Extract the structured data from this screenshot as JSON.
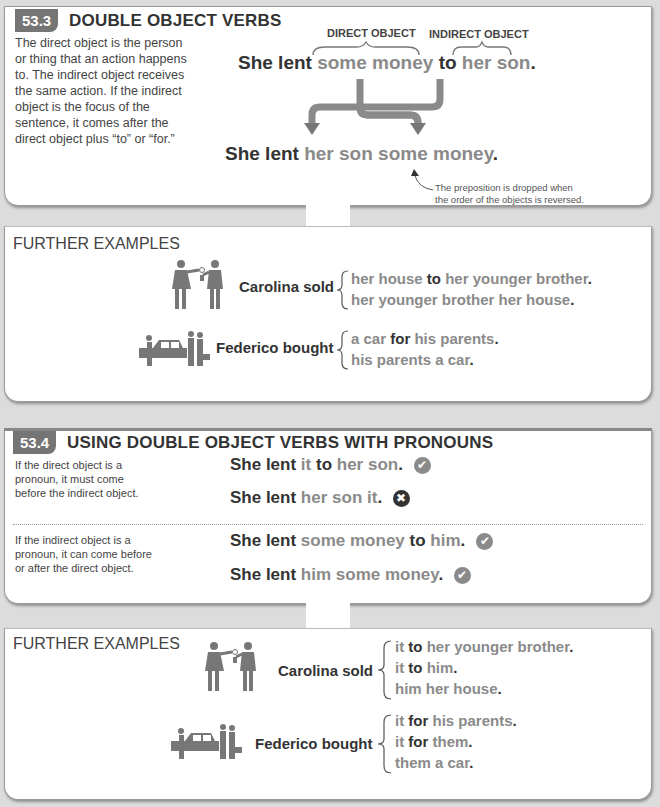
{
  "section1": {
    "number": "53.3",
    "title": "DOUBLE OBJECT VERBS",
    "description": [
      "The direct object is the person",
      "or thing that an action happens",
      "to. The indirect object receives",
      "the same action. If the indirect",
      "object is the focus of the",
      "sentence, it comes after the",
      "direct object plus “to” or “for.”"
    ],
    "direct_object_label": "DIRECT OBJECT",
    "indirect_object_label": "INDIRECT OBJECT",
    "sentence1": {
      "subject": "She lent",
      "direct": "some money",
      "prep": "to",
      "indirect": "her son",
      "end": "."
    },
    "sentence2": {
      "subject": "She lent",
      "indirect": "her son",
      "direct": "some money",
      "end": "."
    },
    "note": [
      "The preposition is dropped when",
      "the order of the objects is reversed."
    ]
  },
  "examples1": {
    "title": "FURTHER EXAMPLES",
    "items": [
      {
        "icon": "people-handing-keys-icon",
        "subject": "Carolina sold",
        "options": [
          {
            "a": "her house",
            "prep": "to",
            "b": "her younger brother",
            "end": "."
          },
          {
            "a": "her younger brother her house",
            "prep": "",
            "b": "",
            "end": "."
          }
        ]
      },
      {
        "icon": "people-with-car-icon",
        "subject": "Federico bought",
        "options": [
          {
            "a": "a car",
            "prep": "for",
            "b": "his parents",
            "end": "."
          },
          {
            "a": "his parents a car",
            "prep": "",
            "b": "",
            "end": "."
          }
        ]
      }
    ]
  },
  "section2": {
    "number": "53.4",
    "title": "USING DOUBLE OBJECT VERBS WITH PRONOUNS",
    "rules": [
      {
        "description": [
          "If the direct object is a",
          "pronoun, it must come",
          "before the indirect object."
        ],
        "sentences": [
          {
            "subject": "She lent",
            "a": "it",
            "prep": "to",
            "b": "her son",
            "end": ".",
            "status": "correct"
          },
          {
            "subject": "She lent",
            "a": "her son it",
            "prep": "",
            "b": "",
            "end": ".",
            "status": "incorrect"
          }
        ]
      },
      {
        "description": [
          "If the indirect object is a",
          "pronoun, it can come before",
          "or after the direct object."
        ],
        "sentences": [
          {
            "subject": "She lent",
            "a": "some money",
            "prep": "to",
            "b": "him",
            "end": ".",
            "status": "correct"
          },
          {
            "subject": "She lent",
            "a": "him some money",
            "prep": "",
            "b": "",
            "end": ".",
            "status": "correct"
          }
        ]
      }
    ]
  },
  "examples2": {
    "title": "FURTHER EXAMPLES",
    "items": [
      {
        "icon": "people-handing-keys-icon",
        "subject": "Carolina sold",
        "options": [
          {
            "a": "it",
            "prep": "to",
            "b": "her younger brother",
            "end": "."
          },
          {
            "a": "it",
            "prep": "to",
            "b": "him",
            "end": "."
          },
          {
            "a": "him her house",
            "prep": "",
            "b": "",
            "end": "."
          }
        ]
      },
      {
        "icon": "people-with-car-icon",
        "subject": "Federico bought",
        "options": [
          {
            "a": "it",
            "prep": "for",
            "b": "his parents",
            "end": "."
          },
          {
            "a": "it",
            "prep": "for",
            "b": "them",
            "end": "."
          },
          {
            "a": "them a car",
            "prep": "",
            "b": "",
            "end": "."
          }
        ]
      }
    ]
  },
  "icons": {
    "check": "✔",
    "cross": "✖"
  },
  "colors": {
    "badge": "#757575",
    "object_text": "#8a8a8a",
    "main_text": "#333333",
    "background": "#dcdcdc"
  }
}
